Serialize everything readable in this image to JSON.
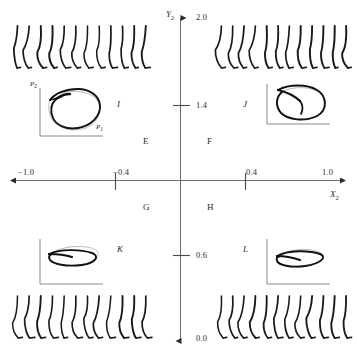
{
  "figure": {
    "background_color": "#ffffff",
    "ink_color": "#2b2b2b",
    "trace_color": "#1a1a1a",
    "ghost_color": "#b3b3b3"
  },
  "axes": {
    "x": {
      "title": "X",
      "title_sub": "2",
      "ticks": [
        {
          "label": "−1.0",
          "value": -1.0
        },
        {
          "label": "−0.4",
          "value": -0.4
        },
        {
          "label": "0.4",
          "value": 0.4
        },
        {
          "label": "1.0",
          "value": 1.0
        }
      ],
      "range": [
        -1.0,
        1.0
      ],
      "arrows": "both"
    },
    "y": {
      "title": "Y",
      "title_sub": "2",
      "ticks": [
        {
          "label": "2.0",
          "value": 2.0
        },
        {
          "label": "1.4",
          "value": 1.4
        },
        {
          "label": "0.6",
          "value": 0.6
        },
        {
          "label": "0.0",
          "value": 0.0
        }
      ],
      "range": [
        0.0,
        2.0
      ],
      "arrows": "both"
    }
  },
  "quadrant_labels": [
    {
      "id": "E",
      "label": "E",
      "quadrant": "upper-left"
    },
    {
      "id": "F",
      "label": "F",
      "quadrant": "upper-right"
    },
    {
      "id": "G",
      "label": "G",
      "quadrant": "lower-left"
    },
    {
      "id": "H",
      "label": "H",
      "quadrant": "lower-right"
    }
  ],
  "insets": [
    {
      "id": "I",
      "label": "I",
      "label_side": "right",
      "x_axis_label": "P",
      "x_axis_sub": "1",
      "y_axis_label": "P",
      "y_axis_sub": "2",
      "show_axis_labels": true,
      "shape": "large-D-loop"
    },
    {
      "id": "J",
      "label": "J",
      "label_side": "left",
      "show_axis_labels": false,
      "shape": "large-D-loop"
    },
    {
      "id": "K",
      "label": "K",
      "label_side": "right",
      "show_axis_labels": false,
      "shape": "flat-loop"
    },
    {
      "id": "L",
      "label": "L",
      "label_side": "left",
      "show_axis_labels": false,
      "shape": "flat-loop"
    }
  ],
  "trace_groups": [
    {
      "id": "top-left",
      "position": "top-left",
      "count": 12,
      "orientation": "hanging-down"
    },
    {
      "id": "top-right",
      "position": "top-right",
      "count": 12,
      "orientation": "hanging-down"
    },
    {
      "id": "bottom-left",
      "position": "bottom-left",
      "count": 12,
      "orientation": "hanging-down"
    },
    {
      "id": "bottom-right",
      "position": "bottom-right",
      "count": 12,
      "orientation": "hanging-down"
    }
  ]
}
